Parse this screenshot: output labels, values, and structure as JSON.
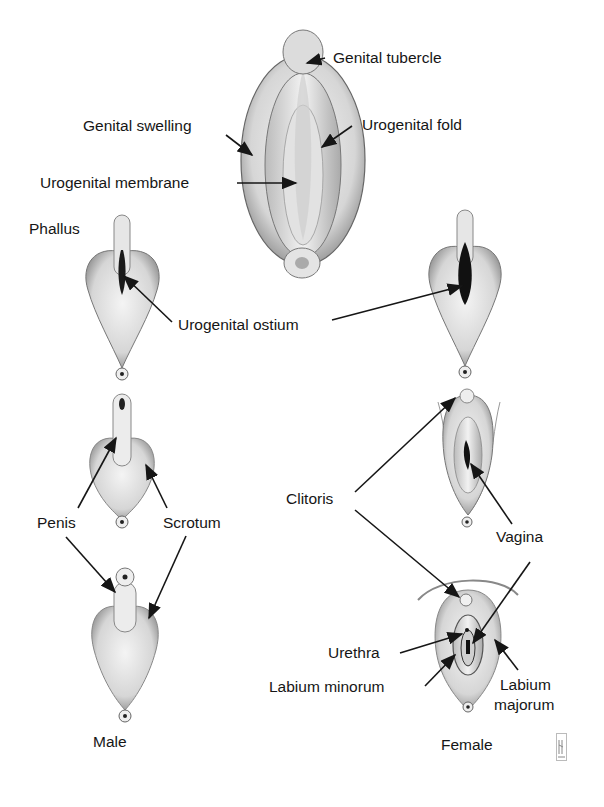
{
  "figure": {
    "indifferent_stage": {
      "labels": {
        "genital_tubercle": "Genital tubercle",
        "genital_swelling": "Genital swelling",
        "urogenital_fold": "Urogenital fold",
        "urogenital_membrane": "Urogenital membrane"
      }
    },
    "early_stage": {
      "phallus": "Phallus",
      "urogenital_ostium": "Urogenital ostium"
    },
    "male": {
      "caption": "Male",
      "penis": "Penis",
      "scrotum": "Scrotum"
    },
    "female": {
      "caption": "Female",
      "clitoris": "Clitoris",
      "vagina": "Vagina",
      "urethra": "Urethra",
      "labium_minorum": "Labium minorum",
      "labium_majorum_line1": "Labium",
      "labium_majorum_line2": "majorum"
    },
    "colors": {
      "ink": "#161616",
      "shade": "#9a9a9a",
      "light": "#e8e8e8"
    }
  }
}
